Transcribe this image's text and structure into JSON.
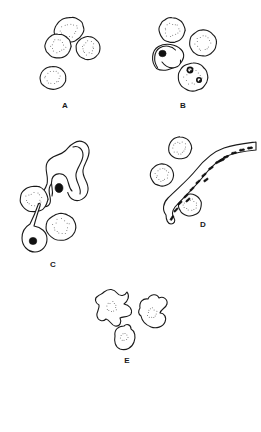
{
  "figure": {
    "background_color": "#ffffff",
    "line_color": "#1a1a1a",
    "stipple_color": "#6a6a6a",
    "nucleus_color": "#111111",
    "width": 261,
    "height": 432
  },
  "panels": [
    {
      "id": "A",
      "label": "A",
      "label_x": 65,
      "label_y": 106,
      "description": "Four round stippled cells",
      "cells": [
        {
          "name": "stippled-cell",
          "cx": 69,
          "cy": 30,
          "rx": 15,
          "ry": 12.5,
          "rot": -18
        },
        {
          "name": "stippled-cell",
          "cx": 58,
          "cy": 46,
          "rx": 13,
          "ry": 12,
          "rot": 0
        },
        {
          "name": "stippled-cell",
          "cx": 88,
          "cy": 48,
          "rx": 12,
          "ry": 11.5,
          "rot": 0
        },
        {
          "name": "stippled-cell",
          "cx": 53,
          "cy": 78,
          "rx": 13,
          "ry": 11.5,
          "rot": 0
        }
      ]
    },
    {
      "id": "B",
      "label": "B",
      "label_x": 183,
      "label_y": 106,
      "description": "Two stippled cells, a crescent gametocyte with dark nucleus, and a cell containing two dark ring forms",
      "cells": [
        {
          "name": "stippled-cell",
          "cx": 172,
          "cy": 30,
          "rx": 13,
          "ry": 12.5,
          "rot": 0
        },
        {
          "name": "stippled-cell",
          "cx": 203,
          "cy": 43,
          "rx": 13.5,
          "ry": 13,
          "rot": 0
        },
        {
          "name": "infected-cell-with-ring-forms",
          "cx": 193,
          "cy": 77,
          "rx": 15,
          "ry": 14,
          "rot": 0
        }
      ],
      "crescent": {
        "name": "crescent-gametocyte",
        "cx": 168,
        "cy": 57
      },
      "ring_forms": [
        {
          "cx": 190,
          "cy": 70,
          "r": 2.6
        },
        {
          "cx": 199,
          "cy": 80,
          "r": 2.2
        }
      ]
    },
    {
      "id": "C",
      "label": "C",
      "label_x": 53,
      "label_y": 265,
      "description": "Large wavy ribbon-shaped form with dark nucleus, two stippled cells and a pear-shaped cell with dark nucleus",
      "cells": [
        {
          "name": "stippled-cell",
          "cx": 34,
          "cy": 199,
          "rx": 14,
          "ry": 13,
          "rot": 0
        },
        {
          "name": "stippled-cell",
          "cx": 61,
          "cy": 227,
          "rx": 15,
          "ry": 13.5,
          "rot": 0
        }
      ],
      "ribbon": {
        "name": "ribbon-trophozoite",
        "nucleus_x": 59,
        "nucleus_y": 188
      },
      "pear_cell": {
        "name": "pear-shaped-cell",
        "cx": 34,
        "cy": 238,
        "nucleus_x": 34,
        "nucleus_y": 240
      }
    },
    {
      "id": "D",
      "label": "D",
      "label_x": 203,
      "label_y": 225,
      "description": "Long curved tubular form filled with dark dashes, surrounded by three stippled cells",
      "cells": [
        {
          "name": "stippled-cell",
          "cx": 180,
          "cy": 148,
          "rx": 11.5,
          "ry": 11,
          "rot": 0
        },
        {
          "name": "stippled-cell",
          "cx": 162,
          "cy": 175,
          "rx": 11.5,
          "ry": 11,
          "rot": 0
        },
        {
          "name": "stippled-cell",
          "cx": 190,
          "cy": 205,
          "rx": 11.5,
          "ry": 11,
          "rot": 0
        }
      ],
      "tube": {
        "name": "dashed-tubular-form",
        "dash_count": 16
      }
    },
    {
      "id": "E",
      "label": "E",
      "label_x": 127,
      "label_y": 361,
      "description": "Three irregular crenated amoeboid cells",
      "cells": [
        {
          "name": "crenated-cell",
          "cx": 110,
          "cy": 307
        },
        {
          "name": "crenated-cell",
          "cx": 150,
          "cy": 316
        },
        {
          "name": "crenated-cell",
          "cx": 122,
          "cy": 339
        }
      ]
    }
  ]
}
